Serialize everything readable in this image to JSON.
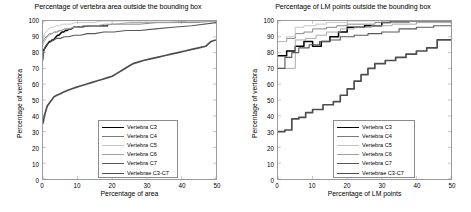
{
  "figure": {
    "width": 471,
    "height": 212,
    "background": "#ffffff"
  },
  "series_styles": [
    {
      "name": "Vertebra C3",
      "color": "#000000",
      "width": 1.5
    },
    {
      "name": "Vertebra C4",
      "color": "#7a7a7a",
      "width": 0.9
    },
    {
      "name": "Vertebra C5",
      "color": "#c2c2c2",
      "width": 0.9
    },
    {
      "name": "Vertebra C6",
      "color": "#a0a0a0",
      "width": 0.9
    },
    {
      "name": "Vertebra C7",
      "color": "#585858",
      "width": 1.1
    },
    {
      "name": "Vertebrae C3-C7",
      "color": "#4d4d4d",
      "width": 1.7
    }
  ],
  "chart_data": [
    {
      "id": "area",
      "type": "line",
      "title": "Percentage of vertebra area outside the bounding box",
      "xlabel": "Percentage of area",
      "ylabel": "Percentage of vertebra",
      "xlim": [
        0,
        50
      ],
      "ylim": [
        0,
        100
      ],
      "xticks": [
        0,
        10,
        20,
        30,
        40,
        50
      ],
      "yticks": [
        0,
        10,
        20,
        30,
        40,
        50,
        60,
        70,
        80,
        90,
        100
      ],
      "grid": false,
      "legend_position": "lower right",
      "legend_entries": [
        "Vertebra C3",
        "Vertebra C4",
        "Vertebra C5",
        "Vertebra C6",
        "Vertebra C7",
        "Vertebrae C3-C7"
      ],
      "series": [
        {
          "name": "Vertebra C3",
          "x": [
            0,
            0.3,
            0.6,
            0.9,
            1.2,
            1.5,
            1.8,
            2.2,
            2.6,
            3.0,
            3.4,
            3.8,
            4.2,
            4.6,
            5.0,
            5.5,
            6.0,
            6.5,
            7.0,
            7.6,
            8.2,
            8.8,
            9.4,
            9.8,
            13.5,
            18.8
          ],
          "y": [
            81,
            82,
            83,
            84,
            85,
            86,
            87,
            87,
            88,
            88,
            89,
            90,
            91,
            91,
            92,
            93,
            93,
            94,
            94,
            95,
            95,
            96,
            96,
            96,
            97,
            97
          ]
        },
        {
          "name": "Vertebra C4",
          "x": [
            0,
            0.2,
            0.5,
            0.9,
            1.4,
            2.0,
            2.6,
            3.2,
            3.9,
            4.6,
            5.4,
            6.2,
            7.1,
            8.0,
            9.0,
            10.2,
            11.5,
            13.0,
            15.0,
            17.5,
            20.0,
            24.0,
            28.0,
            33.0,
            38.0,
            44.0,
            50.0
          ],
          "y": [
            87,
            88,
            89,
            90,
            91,
            92,
            92,
            93,
            93,
            94,
            94,
            95,
            95,
            95,
            96,
            96,
            96,
            97,
            97,
            97,
            98,
            98,
            98,
            99,
            99,
            99,
            100
          ]
        },
        {
          "name": "Vertebra C5",
          "x": [
            0,
            0.2,
            0.5,
            0.8,
            1.2,
            1.7,
            2.3,
            3.0,
            3.8,
            4.7,
            5.7,
            6.8,
            8.0,
            9.3,
            10.8,
            12.5,
            14.5,
            17.0,
            20.0,
            24.0,
            29.0,
            34.0,
            40.0,
            46.0,
            50.0
          ],
          "y": [
            88,
            90,
            92,
            93,
            94,
            95,
            96,
            96,
            97,
            97,
            98,
            98,
            98,
            99,
            99,
            99,
            99,
            100,
            100,
            100,
            100,
            100,
            100,
            100,
            100
          ]
        },
        {
          "name": "Vertebra C6",
          "x": [
            0,
            0.3,
            0.7,
            1.2,
            1.8,
            2.5,
            3.3,
            4.2,
            5.2,
            6.3,
            7.5,
            8.8,
            10.2,
            11.8,
            13.5,
            15.5,
            18.0,
            21.0,
            25.0,
            30.0,
            36.0,
            42.0,
            50.0
          ],
          "y": [
            85,
            87,
            88,
            90,
            91,
            92,
            93,
            93,
            94,
            95,
            95,
            96,
            96,
            97,
            97,
            97,
            98,
            98,
            99,
            99,
            99,
            100,
            100
          ]
        },
        {
          "name": "Vertebra C7",
          "x": [
            0,
            0.2,
            0.5,
            1.0,
            1.6,
            2.3,
            3.1,
            4.0,
            5.0,
            6.2,
            7.5,
            9.0,
            10.8,
            12.8,
            15.0,
            17.5,
            20.5,
            24.0,
            28.0,
            32.5,
            37.5,
            43.0,
            50.0
          ],
          "y": [
            75,
            80,
            83,
            85,
            86,
            87,
            88,
            89,
            89,
            90,
            90,
            91,
            91,
            92,
            92,
            93,
            93,
            94,
            94,
            95,
            96,
            97,
            99
          ]
        },
        {
          "name": "Vertebrae C3-C7",
          "x": [
            0,
            0.4,
            0.8,
            1.2,
            1.8,
            2.5,
            3.2,
            4.0,
            5.0,
            6.0,
            7.0,
            8.2,
            9.5,
            11.0,
            12.5,
            14.0,
            15.5,
            17.0,
            18.5,
            20.0,
            21.5,
            23.0,
            24.5,
            26.0,
            27.5,
            29.0,
            31.0,
            33.0,
            35.0,
            37.0,
            39.0,
            41.0,
            43.0,
            45.0,
            47.0,
            48.5,
            50.0
          ],
          "y": [
            35,
            40,
            43,
            46,
            48,
            50,
            52,
            53,
            54,
            55,
            56,
            57,
            58,
            59,
            60,
            61,
            62,
            63,
            64,
            65,
            67,
            69,
            71,
            73,
            74,
            75,
            76,
            77,
            78,
            79,
            80,
            81,
            82,
            83,
            84,
            87,
            88
          ]
        }
      ]
    },
    {
      "id": "lm",
      "type": "line",
      "title": "Percentage of LM points outside the bounding box",
      "xlabel": "Percentage of LM points",
      "ylabel": "Percentage of vertebra",
      "xlim": [
        0,
        50
      ],
      "ylim": [
        0,
        100
      ],
      "xticks": [
        0,
        10,
        20,
        30,
        40,
        50
      ],
      "yticks": [
        0,
        10,
        20,
        30,
        40,
        50,
        60,
        70,
        80,
        90,
        100
      ],
      "grid": false,
      "legend_position": "lower right",
      "legend_entries": [
        "Vertebra C3",
        "Vertebra C4",
        "Vertebra C5",
        "Vertebra C6",
        "Vertebra C7",
        "Vertebrae C3-C7"
      ],
      "series": [
        {
          "name": "Vertebra C3",
          "x": [
            0,
            2.5,
            2.5,
            5,
            5,
            7.5,
            7.5,
            10,
            10,
            12.5,
            12.5,
            15,
            15,
            17.5,
            17.5,
            20,
            20,
            25,
            25,
            30,
            30,
            32.5,
            32.5,
            50
          ],
          "y": [
            78,
            78,
            81,
            81,
            84,
            84,
            87,
            87,
            84,
            84,
            87,
            87,
            90,
            90,
            93,
            93,
            96,
            96,
            97,
            97,
            99,
            99,
            100,
            100
          ]
        },
        {
          "name": "Vertebra C4",
          "x": [
            0,
            2.5,
            2.5,
            5,
            5,
            7.5,
            7.5,
            10,
            10,
            14,
            14,
            17,
            17,
            20,
            20,
            24,
            24,
            28,
            28,
            33,
            33,
            38,
            38,
            44,
            44,
            50
          ],
          "y": [
            87,
            87,
            89,
            89,
            92,
            92,
            93,
            93,
            95,
            95,
            96,
            96,
            97,
            97,
            98,
            98,
            98,
            98,
            99,
            99,
            99,
            99,
            100,
            100,
            100,
            100
          ]
        },
        {
          "name": "Vertebra C5",
          "x": [
            0,
            2.5,
            2.5,
            5,
            5,
            7.5,
            7.5,
            11,
            11,
            14,
            14,
            17,
            17,
            20,
            20,
            50
          ],
          "y": [
            87,
            87,
            90,
            90,
            96,
            96,
            97,
            97,
            98,
            98,
            99,
            99,
            99,
            99,
            100,
            100
          ]
        },
        {
          "name": "Vertebra C6",
          "x": [
            0,
            2.5,
            2.5,
            5,
            5,
            8,
            8,
            11,
            11,
            14,
            14,
            18,
            18,
            22,
            22,
            27,
            27,
            33,
            33,
            40,
            40,
            50
          ],
          "y": [
            70,
            70,
            70,
            70,
            88,
            88,
            89,
            89,
            91,
            91,
            93,
            93,
            95,
            95,
            96,
            96,
            97,
            97,
            98,
            98,
            99,
            99
          ]
        },
        {
          "name": "Vertebra C7",
          "x": [
            0,
            2,
            2,
            4,
            4,
            6,
            6,
            9,
            9,
            12,
            12,
            15,
            15,
            18,
            18,
            22,
            22,
            26,
            26,
            30,
            30,
            35,
            35,
            40,
            40,
            45,
            45,
            50
          ],
          "y": [
            70,
            70,
            77,
            77,
            80,
            80,
            83,
            83,
            85,
            85,
            87,
            87,
            88,
            88,
            90,
            90,
            91,
            91,
            92,
            92,
            93,
            93,
            95,
            95,
            96,
            96,
            97,
            97
          ]
        },
        {
          "name": "Vertebrae C3-C7",
          "x": [
            0,
            2,
            2,
            4,
            4,
            6,
            6,
            8,
            8,
            10,
            10,
            13,
            13,
            16,
            16,
            18,
            18,
            20,
            20,
            22,
            22,
            24,
            24,
            26,
            26,
            28,
            28,
            31,
            31,
            34,
            34,
            37,
            37,
            40,
            40,
            43,
            43,
            46,
            46,
            50
          ],
          "y": [
            30,
            30,
            31,
            31,
            38,
            38,
            39,
            39,
            42,
            42,
            44,
            44,
            47,
            47,
            49,
            49,
            53,
            53,
            57,
            57,
            62,
            62,
            66,
            66,
            70,
            70,
            73,
            73,
            75,
            75,
            77,
            77,
            79,
            79,
            81,
            81,
            83,
            83,
            88,
            88
          ]
        }
      ]
    }
  ]
}
